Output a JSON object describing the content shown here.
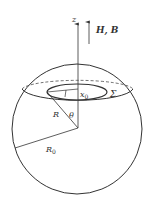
{
  "diagram": {
    "labels": {
      "z_axis": "z",
      "field": "H, B",
      "x0": "x",
      "x0_sub": "0",
      "sigma": "Σ",
      "R": "R",
      "theta": "θ",
      "R0": "R",
      "R0_sub": "0"
    },
    "colors": {
      "stroke": "#333333",
      "background": "#ffffff"
    }
  }
}
